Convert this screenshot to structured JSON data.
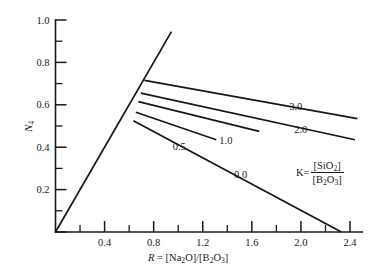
{
  "chart_data": {
    "type": "line",
    "title": "",
    "xlabel": "R = [Na2O]/[B2O3]",
    "ylabel": "N4",
    "xlim": [
      0,
      2.55
    ],
    "ylim": [
      0,
      1.0
    ],
    "grid": false,
    "legend_position": "inline-curve-labels",
    "x_ticks_major": [
      "0.4",
      "0.8",
      "1.2",
      "1.6",
      "2.0",
      "2.4"
    ],
    "x_ticks_major_values": [
      0.4,
      0.8,
      1.2,
      1.6,
      2.0,
      2.4
    ],
    "x_ticks_minor_values": [
      0.2,
      0.6,
      1.0,
      1.4,
      1.8,
      2.2
    ],
    "y_ticks_major": [
      "0",
      "0.2",
      "0.4",
      "0.6",
      "0.8",
      "1.0"
    ],
    "y_ticks_major_values": [
      0,
      0.2,
      0.4,
      0.6,
      0.8,
      1.0
    ],
    "y_ticks_minor_values": [
      0.1,
      0.3,
      0.5,
      0.7,
      0.9
    ],
    "annotation_K": "K = [SiO2] / [B2O3]",
    "series": [
      {
        "name": "N4 = R (baseline rising line)",
        "label": "",
        "points": [
          [
            0.0,
            0.0
          ],
          [
            0.945,
            0.945
          ]
        ]
      },
      {
        "name": "0.0",
        "label": "0.0",
        "label_x": 1.52,
        "label_y": 0.265,
        "points": [
          [
            0.635,
            0.525
          ],
          [
            2.33,
            0.0
          ]
        ]
      },
      {
        "name": "0.5",
        "label": "0.5",
        "label_x": 1.02,
        "label_y": 0.395,
        "points": [
          [
            0.655,
            0.565
          ],
          [
            1.31,
            0.435
          ]
        ]
      },
      {
        "name": "1.0",
        "label": "1.0",
        "label_x": 1.4,
        "label_y": 0.425,
        "points": [
          [
            0.675,
            0.615
          ],
          [
            1.66,
            0.475
          ]
        ]
      },
      {
        "name": "2.0",
        "label": "2.0",
        "label_x": 2.01,
        "label_y": 0.475,
        "points": [
          [
            0.695,
            0.655
          ],
          [
            2.44,
            0.435
          ]
        ]
      },
      {
        "name": "3.0",
        "label": "3.0",
        "label_x": 1.97,
        "label_y": 0.585,
        "points": [
          [
            0.725,
            0.715
          ],
          [
            2.46,
            0.535
          ]
        ]
      }
    ]
  },
  "axis_titles": {
    "x_prefix": "R",
    "x_equals": " = [",
    "x_part1": "Na",
    "x_sub1": "2",
    "x_part2": "O]/[B",
    "x_sub2": "2",
    "x_part3": "O",
    "x_sub3": "3",
    "x_part4": "]",
    "y_main": "N",
    "y_sub": "4"
  },
  "k_annotation": {
    "symbol": "K=",
    "numerator_main": "[SiO",
    "numerator_sub": "2",
    "numerator_tail": "]",
    "denominator_main": "[B",
    "denominator_sub1": "2",
    "denominator_mid": "O",
    "denominator_sub2": "3",
    "denominator_tail": "]"
  },
  "colors": {
    "background": "#ffffff",
    "ink": "#1a1a1a",
    "curve": "#171717"
  }
}
